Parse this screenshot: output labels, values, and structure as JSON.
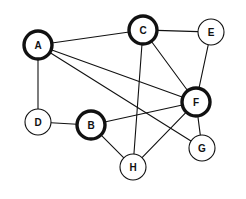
{
  "diagram": {
    "type": "undirected-graph",
    "background_color": "#ffffff",
    "edge_color": "#111111",
    "node_fill_color": "#ffffff",
    "node_stroke_color": "#111111",
    "width": 246,
    "height": 199,
    "nodes": [
      {
        "id": "A",
        "label": "A",
        "cx": 38,
        "cy": 45,
        "r": 14,
        "emphasis": "thick"
      },
      {
        "id": "B",
        "label": "B",
        "cx": 91,
        "cy": 125,
        "r": 14,
        "emphasis": "thick"
      },
      {
        "id": "C",
        "label": "C",
        "cx": 143,
        "cy": 30,
        "r": 14,
        "emphasis": "thick"
      },
      {
        "id": "D",
        "label": "D",
        "cx": 38,
        "cy": 122,
        "r": 13,
        "emphasis": "thin"
      },
      {
        "id": "E",
        "label": "E",
        "cx": 211,
        "cy": 32,
        "r": 13,
        "emphasis": "thin"
      },
      {
        "id": "F",
        "label": "F",
        "cx": 196,
        "cy": 102,
        "r": 14,
        "emphasis": "thick"
      },
      {
        "id": "G",
        "label": "G",
        "cx": 202,
        "cy": 148,
        "r": 13,
        "emphasis": "thin"
      },
      {
        "id": "H",
        "label": "H",
        "cx": 133,
        "cy": 167,
        "r": 13,
        "emphasis": "thin"
      }
    ],
    "edges": [
      {
        "source": "A",
        "target": "C"
      },
      {
        "source": "A",
        "target": "D"
      },
      {
        "source": "A",
        "target": "F"
      },
      {
        "source": "A",
        "target": "G"
      },
      {
        "source": "B",
        "target": "D"
      },
      {
        "source": "B",
        "target": "F"
      },
      {
        "source": "B",
        "target": "H"
      },
      {
        "source": "C",
        "target": "E"
      },
      {
        "source": "C",
        "target": "F"
      },
      {
        "source": "C",
        "target": "H"
      },
      {
        "source": "E",
        "target": "F"
      },
      {
        "source": "F",
        "target": "G"
      },
      {
        "source": "F",
        "target": "H"
      }
    ]
  }
}
